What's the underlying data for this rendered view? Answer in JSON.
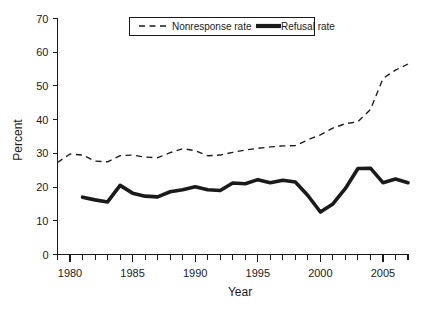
{
  "chart_data": {
    "type": "line",
    "title": "",
    "xlabel": "Year",
    "ylabel": "Percent",
    "xlim": [
      1979,
      2007
    ],
    "ylim": [
      0,
      70
    ],
    "grid": false,
    "legend_position": "top-center",
    "x": [
      1979,
      1980,
      1981,
      1982,
      1983,
      1984,
      1985,
      1986,
      1987,
      1988,
      1989,
      1990,
      1991,
      1992,
      1993,
      1994,
      1995,
      1996,
      1997,
      1998,
      1999,
      2000,
      2001,
      2002,
      2003,
      2004,
      2005,
      2006,
      2007
    ],
    "xticks": [
      1980,
      1985,
      1990,
      1995,
      2000,
      2005
    ],
    "xtick_labels": [
      "1980",
      "1985",
      "1990",
      "1995",
      "2000",
      "2005"
    ],
    "yticks": [
      0,
      10,
      20,
      30,
      40,
      50,
      60,
      70
    ],
    "ytick_labels": [
      "0",
      "10",
      "20",
      "30",
      "40",
      "50",
      "60",
      "70"
    ],
    "series": [
      {
        "name": "Nonresponse rate",
        "style": "dashed",
        "color": "#1a1a1a",
        "x": [
          1979,
          1980,
          1981,
          1982,
          1983,
          1984,
          1985,
          1986,
          1987,
          1988,
          1989,
          1990,
          1991,
          1992,
          1993,
          1994,
          1995,
          1996,
          1997,
          1998,
          1999,
          2000,
          2001,
          2002,
          2003,
          2004,
          2005,
          2006,
          2007
        ],
        "values": [
          27.3,
          29.8,
          29.5,
          27.7,
          27.5,
          29.3,
          29.5,
          28.9,
          28.7,
          30.2,
          31.4,
          30.8,
          29.3,
          29.5,
          30.3,
          31.0,
          31.5,
          31.9,
          32.2,
          32.3,
          34.0,
          35.5,
          37.5,
          38.8,
          39.4,
          43.0,
          52.2,
          54.7,
          56.5
        ]
      },
      {
        "name": "Refusal rate",
        "style": "solid",
        "color": "#1a1a1a",
        "x": [
          1981,
          1982,
          1983,
          1984,
          1985,
          1986,
          1987,
          1988,
          1989,
          1990,
          1991,
          1992,
          1993,
          1994,
          1995,
          1996,
          1997,
          1998,
          1999,
          2000,
          2001,
          2002,
          2003,
          2004,
          2005,
          2006,
          2007
        ],
        "values": [
          17.0,
          16.2,
          15.6,
          20.5,
          18.2,
          17.3,
          17.1,
          18.6,
          19.2,
          20.1,
          19.2,
          19.0,
          21.2,
          21.0,
          22.2,
          21.3,
          22.0,
          21.5,
          17.5,
          12.6,
          15.0,
          19.6,
          25.5,
          25.6,
          21.3,
          22.4,
          21.3
        ]
      }
    ]
  },
  "legend": {
    "entries": [
      {
        "label": "Nonresponse rate",
        "style": "dashed"
      },
      {
        "label": "Refusal rate",
        "style": "solid"
      }
    ]
  },
  "axes": {
    "x_title": "Year",
    "y_title": "Percent"
  }
}
